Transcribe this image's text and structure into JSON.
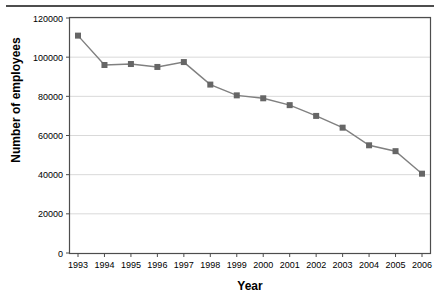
{
  "chart_data": {
    "type": "line",
    "title": "",
    "subtitle": "",
    "xlabel": "Year",
    "ylabel": "Number of employees",
    "categories": [
      "1993",
      "1994",
      "1995",
      "1996",
      "1997",
      "1998",
      "1999",
      "2000",
      "2001",
      "2002",
      "2003",
      "2004",
      "2005",
      "2006"
    ],
    "x": [
      1993,
      1994,
      1995,
      1996,
      1997,
      1998,
      1999,
      2000,
      2001,
      2002,
      2003,
      2004,
      2005,
      2006
    ],
    "values": [
      111000,
      96000,
      96500,
      95000,
      97500,
      86000,
      80500,
      79000,
      75500,
      70000,
      64000,
      55000,
      52000,
      40500
    ],
    "series": [
      {
        "name": "Number of employees",
        "values": [
          111000,
          96000,
          96500,
          95000,
          97500,
          86000,
          80500,
          79000,
          75500,
          70000,
          64000,
          55000,
          52000,
          40500
        ]
      }
    ],
    "ylim": [
      0,
      120000
    ],
    "yticks": [
      0,
      20000,
      40000,
      60000,
      80000,
      100000,
      120000
    ],
    "ytick_labels": [
      "0",
      "20000",
      "40000",
      "60000",
      "80000",
      "100000",
      "120000"
    ],
    "xtick_labels": [
      "1993",
      "1994",
      "1995",
      "1996",
      "1997",
      "1998",
      "1999",
      "2000",
      "2001",
      "2002",
      "2003",
      "2004",
      "2005",
      "2006"
    ],
    "grid": "horizontal",
    "legend": "none",
    "marker": "square",
    "colors": {
      "line": "#808080",
      "marker": "#666666",
      "axis": "#4d4d4d",
      "grid": "#d9d9d9",
      "background": "#ffffff",
      "text": "#000000"
    }
  }
}
